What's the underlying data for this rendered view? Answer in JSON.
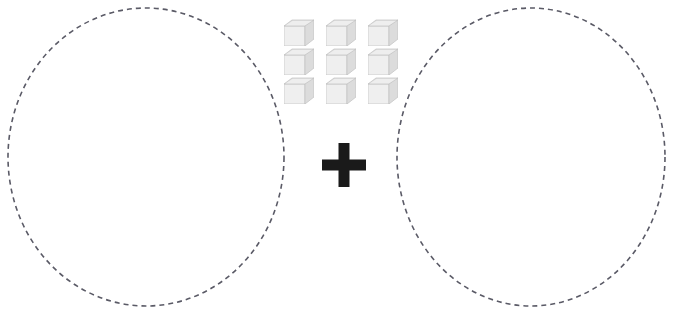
{
  "canvas": {
    "width": 674,
    "height": 314,
    "background": "#ffffff"
  },
  "sets": {
    "label_left": "Left set circle (empty)",
    "label_right": "Right set circle (empty)",
    "count_left": 0,
    "count_right": 0,
    "style": "dashed",
    "stroke_color": "#5a5a66",
    "stroke_width": 1.6,
    "dash_pattern": "5 4",
    "fill": "none",
    "left": {
      "cx": 146,
      "cy": 157,
      "rx": 138,
      "ry": 149
    },
    "right": {
      "cx": 531,
      "cy": 157,
      "rx": 134,
      "ry": 149
    }
  },
  "manipulatives": {
    "label": "cube-block",
    "shape": "cube",
    "count": 9,
    "rows": 3,
    "columns": 3,
    "origin_x": 284,
    "origin_y": 18,
    "colors": {
      "front": "#efefef",
      "top": "#d9d9d9",
      "side": "#dcdcdc",
      "edge": "#c2c2c2",
      "top_highlight": "#f4f4f4"
    },
    "items": [
      {
        "id": 1,
        "row": 1,
        "col": 1
      },
      {
        "id": 2,
        "row": 1,
        "col": 2
      },
      {
        "id": 3,
        "row": 1,
        "col": 3
      },
      {
        "id": 4,
        "row": 2,
        "col": 1
      },
      {
        "id": 5,
        "row": 2,
        "col": 2
      },
      {
        "id": 6,
        "row": 2,
        "col": 3
      },
      {
        "id": 7,
        "row": 3,
        "col": 1
      },
      {
        "id": 8,
        "row": 3,
        "col": 2
      },
      {
        "id": 9,
        "row": 3,
        "col": 3
      }
    ]
  },
  "operator": {
    "symbol": "+",
    "name": "plus",
    "color": "#1a1a1a",
    "x": 322,
    "y": 143,
    "size": 44,
    "arm_thickness": 11
  }
}
